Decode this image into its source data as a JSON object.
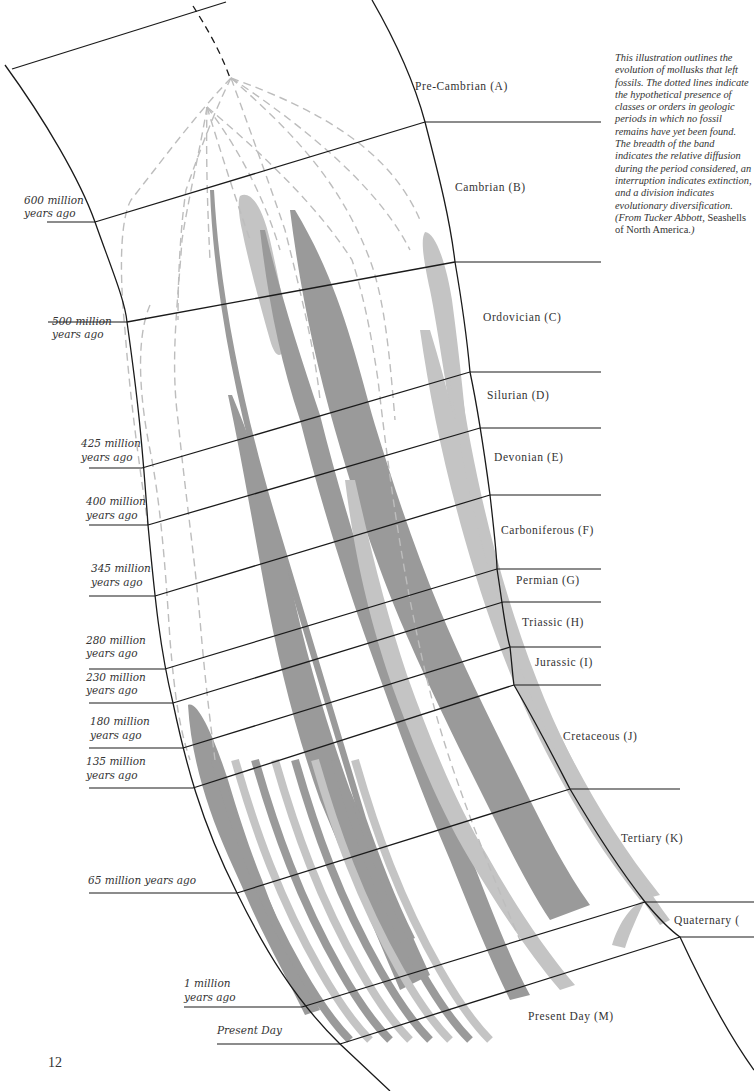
{
  "page_number": "12",
  "caption": {
    "text": "This illustration outlines the evolution of mollusks that left fossils. The dotted lines indicate the hypothetical presence of classes or orders in geologic periods in which no fossil remains have yet been found. The breadth of the band indicates the relative diffusion during the period considered, an interruption indicates extinction, and a division indicates evolutionary diversification.",
    "source_prefix": "(From Tucker Abbott,",
    "source_book": "Seashells of North America.",
    "source_suffix": ")"
  },
  "periods": [
    {
      "id": "A",
      "label": "Pre-Cambrian (A)"
    },
    {
      "id": "B",
      "label": "Cambrian (B)"
    },
    {
      "id": "C",
      "label": "Ordovician (C)"
    },
    {
      "id": "D",
      "label": "Silurian (D)"
    },
    {
      "id": "E",
      "label": "Devonian (E)"
    },
    {
      "id": "F",
      "label": "Carboniferous (F)"
    },
    {
      "id": "G",
      "label": "Permian (G)"
    },
    {
      "id": "H",
      "label": "Triassic (H)"
    },
    {
      "id": "I",
      "label": "Jurassic (I)"
    },
    {
      "id": "J",
      "label": "Cretaceous (J)"
    },
    {
      "id": "K",
      "label": "Tertiary (K)"
    },
    {
      "id": "L",
      "label": "Quaternary ("
    },
    {
      "id": "M",
      "label": "Present Day (M)"
    }
  ],
  "ages": [
    {
      "line1": "600 million",
      "line2": "years ago"
    },
    {
      "line1": "500 million",
      "line2": "years ago"
    },
    {
      "line1": "425 million",
      "line2": "years ago"
    },
    {
      "line1": "400 million",
      "line2": "years ago"
    },
    {
      "line1": "345 million",
      "line2": "years ago"
    },
    {
      "line1": "280 million",
      "line2": "years ago"
    },
    {
      "line1": "230 million",
      "line2": "years ago"
    },
    {
      "line1": "180 million",
      "line2": "years ago"
    },
    {
      "line1": "135 million",
      "line2": "years ago"
    },
    {
      "line1": "65 million years ago",
      "line2": ""
    },
    {
      "line1": "1 million",
      "line2": "years ago"
    },
    {
      "line1": "Present Day",
      "line2": ""
    }
  ],
  "colors": {
    "ink": "#1a1a1a",
    "band_dark": "#9a9a9a",
    "band_light": "#c4c4c4",
    "dashed": "#bdbdbd"
  }
}
